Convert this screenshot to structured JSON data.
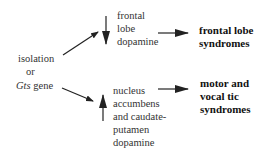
{
  "diagram": {
    "source": {
      "line1": "isolation",
      "line2": "or",
      "line3_italic": "Gts",
      "line3_rest": " gene"
    },
    "top_node": {
      "lines": [
        "frontal",
        "lobe",
        "dopamine"
      ]
    },
    "bottom_node": {
      "lines": [
        "nucleus",
        "accumbens",
        "and caudate-",
        "putamen",
        "dopamine"
      ]
    },
    "top_outcome": {
      "lines": [
        "frontal lobe",
        "syndromes"
      ]
    },
    "bottom_outcome": {
      "lines": [
        "motor and",
        "vocal tic",
        "syndromes"
      ]
    },
    "arrows": [
      {
        "from": "source",
        "to": "top_node"
      },
      {
        "from": "source",
        "to": "bottom_node"
      },
      {
        "direction": "down",
        "into": "top_node"
      },
      {
        "direction": "up",
        "into": "bottom_node"
      },
      {
        "from": "top_node",
        "to": "top_outcome"
      },
      {
        "from": "bottom_node",
        "to": "bottom_outcome"
      }
    ]
  }
}
